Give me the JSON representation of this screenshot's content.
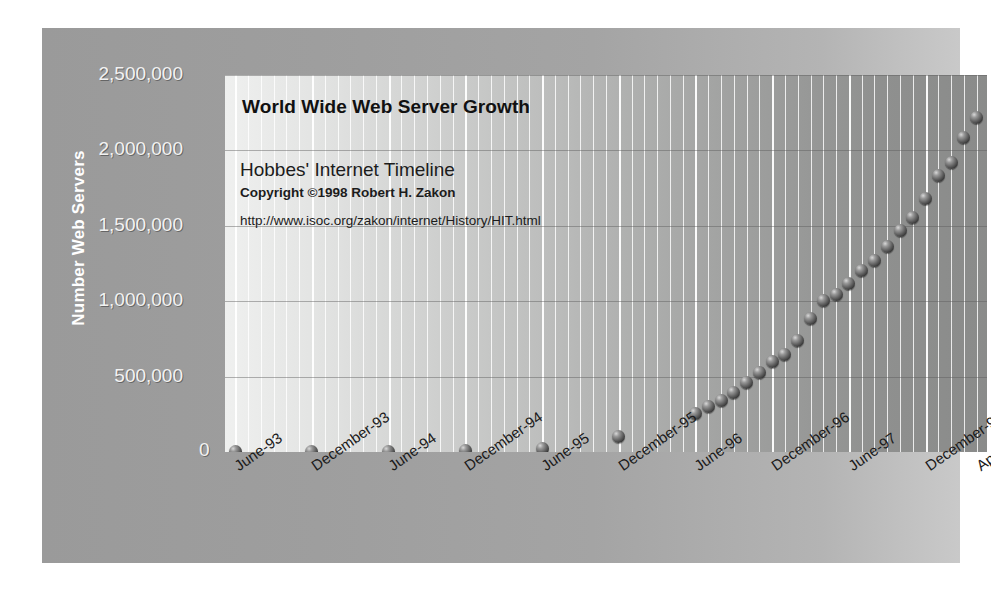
{
  "figure": {
    "background_color": "#ffffff",
    "frame_color": "#a0a0a0"
  },
  "chart_data": {
    "type": "scatter",
    "title": "World Wide Web Server Growth",
    "xlabel": "",
    "ylabel": "Number Web Servers",
    "ylim": [
      0,
      2500000
    ],
    "ytick_labels": [
      "2,500,000",
      "2,000,000",
      "1,500,000",
      "1,000,000",
      "500,000",
      "0"
    ],
    "ytick_values": [
      2500000,
      2000000,
      1500000,
      1000000,
      500000,
      0
    ],
    "xtick_labels": [
      "June-93",
      "December-93",
      "June-94",
      "December-94",
      "June-95",
      "December-95",
      "June-96",
      "December-96",
      "June-97",
      "December-97",
      "April-98"
    ],
    "grid": "vertical monthly gridlines, horizontal gridlines at each 500,000",
    "legend": "none",
    "marker": "3D sphere",
    "marker_color": "#3a3a3a",
    "annotations": [
      "Hobbes' Internet Timeline",
      "Copyright ©1998 Robert H. Zakon",
      "http://www.isoc.org/zakon/internet/History/HIT.html"
    ],
    "x": [
      "June-93",
      "December-93",
      "June-94",
      "December-94",
      "June-95",
      "December-95",
      "June-96",
      "July-96",
      "August-96",
      "September-96",
      "October-96",
      "November-96",
      "December-96",
      "January-97",
      "February-97",
      "March-97",
      "April-97",
      "May-97",
      "June-97",
      "July-97",
      "August-97",
      "September-97",
      "October-97",
      "November-97",
      "December-97",
      "January-98",
      "February-98",
      "March-98",
      "April-98"
    ],
    "values": [
      130,
      623,
      2738,
      10022,
      23500,
      100000,
      252000,
      299000,
      342000,
      397000,
      462000,
      525000,
      603000,
      646000,
      739000,
      883000,
      1002000,
      1044000,
      1117000,
      1203000,
      1269000,
      1364000,
      1466000,
      1553000,
      1681000,
      1834000,
      1920000,
      2084000,
      2215000
    ],
    "series_name": "Number Web Servers"
  }
}
